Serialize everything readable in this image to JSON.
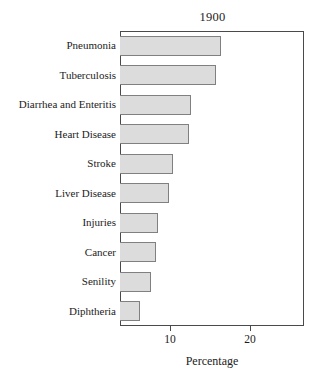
{
  "chart_data": {
    "type": "bar",
    "orientation": "horizontal",
    "title": "1900",
    "xlabel": "Percentage",
    "ylabel": "",
    "categories": [
      "Pneumonia",
      "Tuberculosis",
      "Diarrhea and Enteritis",
      "Heart Disease",
      "Stroke",
      "Liver Disease",
      "Injuries",
      "Cancer",
      "Senility",
      "Diphtheria"
    ],
    "values": [
      16.4,
      15.8,
      12.6,
      12.4,
      10.4,
      9.9,
      8.5,
      8.2,
      7.6,
      6.3
    ],
    "xlim": [
      3.75,
      26.75
    ],
    "xticks": [
      10,
      20
    ],
    "xtick_labels": [
      "10",
      "20"
    ],
    "grid": false,
    "legend": null,
    "bar_fill_color": "#dcdcdc",
    "bar_edge_color": "#808080",
    "frame_color": "#4a4a4a"
  },
  "axis": {
    "ticks": [
      {
        "label": "10",
        "value": 10
      },
      {
        "label": "20",
        "value": 20
      }
    ],
    "title": "Percentage"
  }
}
